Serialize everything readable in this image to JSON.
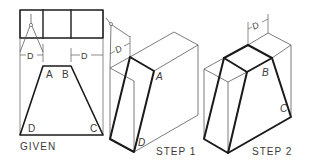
{
  "figure": {
    "panels": [
      {
        "id": "given",
        "caption": "GIVEN",
        "vertex_labels": {
          "a": "A",
          "b": "B",
          "c": "C",
          "d": "D"
        },
        "dimension_labels": [
          "D",
          "D"
        ]
      },
      {
        "id": "step1",
        "caption": "STEP  1",
        "vertex_labels": {
          "a": "A",
          "d": "D"
        },
        "dimension_labels": [
          "D"
        ]
      },
      {
        "id": "step2",
        "caption": "STEP  2",
        "vertex_labels": {
          "b": "B",
          "c": "C"
        },
        "dimension_labels": [
          "D"
        ]
      }
    ],
    "icons": [
      "divider-compass-icon"
    ],
    "colors": {
      "line_thin": "#5a5a5a",
      "line_thick": "#1a1a1a",
      "text": "#3a3a3a",
      "background": "#ffffff"
    }
  }
}
